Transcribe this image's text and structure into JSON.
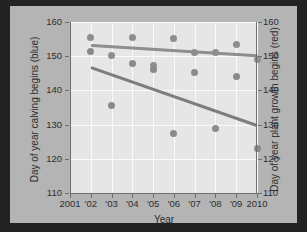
{
  "chart_data": {
    "type": "scatter",
    "title": "",
    "xlabel": "Year",
    "ylabel_left": "Day of year calving begins (blue)",
    "ylabel_right": "Day of year plant growth begins (red)",
    "xlim": [
      2001,
      2010
    ],
    "ylim": [
      110,
      160
    ],
    "ylim_right": [
      110,
      160
    ],
    "grid": true,
    "legend": "none",
    "x_ticks": [
      2001,
      2002,
      2003,
      2004,
      2005,
      2006,
      2007,
      2008,
      2009,
      2010
    ],
    "x_tick_labels": [
      "2001",
      "'02",
      "'03",
      "'04",
      "'05",
      "'06",
      "'07",
      "'08",
      "'09",
      "2010"
    ],
    "y_ticks": [
      110,
      120,
      130,
      140,
      150,
      160
    ],
    "y_tick_labels": [
      "110",
      "120",
      "130",
      "140",
      "150",
      "160"
    ],
    "y_ticks_right": [
      110,
      120,
      130,
      140,
      150,
      160
    ],
    "y_tick_labels_right": [
      "110",
      "120",
      "130",
      "140",
      "150",
      "160"
    ],
    "series": [
      {
        "name": "Day of year calving begins (blue)",
        "color": "#8e8e8e",
        "x": [
          2002,
          2003,
          2004,
          2005,
          2006,
          2007,
          2008,
          2009,
          2010
        ],
        "values": [
          155.5,
          150.2,
          155.4,
          147.2,
          155.3,
          151.2,
          151.0,
          153.3,
          149.0
        ]
      },
      {
        "name": "Day of year plant growth begins (red)",
        "color": "#8a8a8a",
        "x": [
          2002,
          2003,
          2004,
          2005,
          2006,
          2007,
          2008,
          2009,
          2010
        ],
        "values": [
          151.3,
          135.5,
          148.0,
          146.2,
          127.4,
          145.3,
          129.0,
          144.0,
          123.0
        ]
      }
    ],
    "trendlines": [
      {
        "name": "calving-trend",
        "color": "#8e8e8e",
        "x": [
          2002,
          2010
        ],
        "y": [
          153.7,
          150.7
        ]
      },
      {
        "name": "plant-growth-trend",
        "color": "#7d7d7d",
        "x": [
          2002,
          2010
        ],
        "y": [
          147.0,
          130.0
        ]
      }
    ]
  },
  "axes": {
    "x_title": "Year",
    "y_left_title": "Day of year calving begins (blue)",
    "y_right_title": "Day of year plant growth begins (red)"
  }
}
